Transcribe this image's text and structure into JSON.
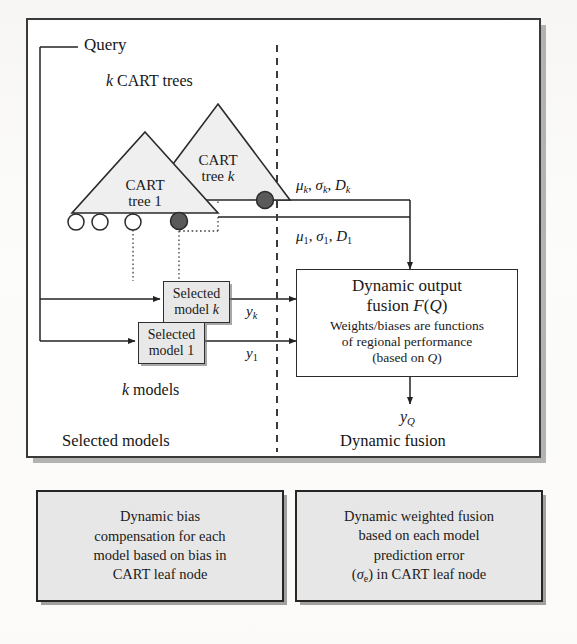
{
  "figure": {
    "title_hidden": "",
    "colors": {
      "tree_fill": "#efefef",
      "box_fill": "#e8e8e8",
      "callout_fill": "#e7e7e7",
      "line": "#232323",
      "dashed_divider": "#3a3a3a",
      "node_filled": "#5a5a5a",
      "node_open": "#ffffff"
    }
  },
  "query": {
    "label": "Query"
  },
  "trees": {
    "group_label_italic": "k",
    "group_label_rest": " CART trees",
    "tree_k": {
      "line1": "CART",
      "line2_pre": "tree ",
      "line2_italic": "k"
    },
    "tree_1": {
      "line1": "CART",
      "line2_pre": "tree ",
      "line2_italic": "1"
    },
    "leaf_nodes": [
      {
        "type": "open"
      },
      {
        "type": "open"
      },
      {
        "type": "open"
      },
      {
        "type": "filled"
      }
    ],
    "tree_k_node": {
      "type": "filled"
    }
  },
  "stats_labels": {
    "top": {
      "mu": "μ",
      "mu_sub": "k",
      "sigma": "σ",
      "sigma_sub": "k",
      "d": "D",
      "d_sub": "k"
    },
    "bottom": {
      "mu": "μ",
      "mu_sub": "1",
      "sigma": "σ",
      "sigma_sub": "1",
      "d": "D",
      "d_sub": "1"
    }
  },
  "models": {
    "selected_model_k": {
      "line1": "Selected",
      "line2_pre": "model ",
      "line2_italic": "k"
    },
    "selected_model_1": {
      "line1": "Selected",
      "line2_pre": "model ",
      "line2_italic": "1"
    },
    "group_label_italic": "k",
    "group_label_rest": " models",
    "output_k": {
      "base": "y",
      "sub": "k"
    },
    "output_1": {
      "base": "y",
      "sub": "1"
    }
  },
  "fusion": {
    "title_line1": "Dynamic output",
    "title_line2_pre": "fusion ",
    "title_line2_italic": "F",
    "title_line2_post_open": "(",
    "title_line2_italic_q": "Q",
    "title_line2_post_close": ")",
    "sub_line1": "Weights/biases are functions",
    "sub_line2": "of regional performance",
    "sub_line3_pre": "(based on ",
    "sub_line3_italic": "Q",
    "sub_line3_post": ")",
    "output": {
      "base": "y",
      "sub": "Q"
    }
  },
  "section_labels": {
    "left": "Selected models",
    "right": "Dynamic fusion"
  },
  "callouts": [
    {
      "id": "dynamic-bias-compensation",
      "lines": [
        "Dynamic bias",
        "compensation for each",
        "model based on bias in",
        "CART leaf node"
      ]
    },
    {
      "id": "dynamic-weighted-fusion",
      "lines": [
        "Dynamic weighted fusion",
        "based on each model",
        "prediction error",
        "(σe) in CART leaf node"
      ],
      "line4_pre": "(",
      "line4_italic": "σ",
      "line4_sub": "e",
      "line4_post": ") in CART leaf node"
    }
  ]
}
